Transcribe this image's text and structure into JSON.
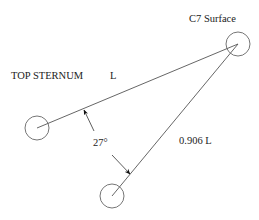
{
  "diagram": {
    "labels": {
      "c7": "C7 Surface",
      "top_sternum": "TOP STERNUM",
      "length_top": "L",
      "angle": "27°",
      "length_bottom": "0.906 L"
    },
    "colors": {
      "stroke": "#555555",
      "text": "#222222",
      "arrow": "#111111",
      "background": "#ffffff"
    },
    "points": {
      "c7": {
        "x": 238,
        "y": 44,
        "r": 12
      },
      "top_sternum": {
        "x": 37,
        "y": 128,
        "r": 12
      },
      "bottom": {
        "x": 112,
        "y": 196,
        "r": 12
      }
    }
  }
}
